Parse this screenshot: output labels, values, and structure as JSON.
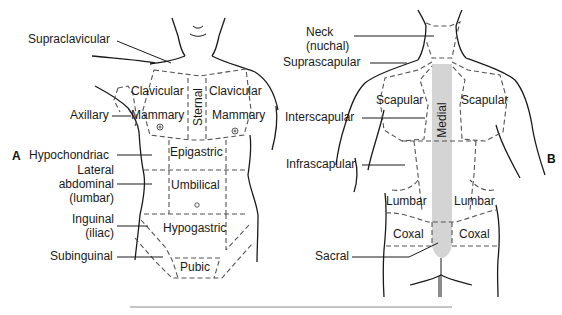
{
  "panels": {
    "A": {
      "letter": "A",
      "view": "anterior",
      "callout_labels": {
        "supraclavicular": "Supraclavicular",
        "axillary": "Axillary",
        "hypochondriac": "Hypochondriac",
        "lateral_abdominal": [
          "Lateral",
          "abdominal",
          "(lumbar)"
        ],
        "inguinal": [
          "Inguinal",
          "(iliac)"
        ],
        "subinguinal": "Subinguinal"
      },
      "region_labels": {
        "clavicular_left": "Clavicular",
        "clavicular_right": "Clavicular",
        "mammary_left": "Mammary",
        "mammary_right": "Mammary",
        "sternal": "Sternal",
        "epigastric": "Epigastric",
        "umbilical": "Umbilical",
        "hypogastric": "Hypogastric",
        "pubic": "Pubic"
      }
    },
    "B": {
      "letter": "B",
      "view": "posterior",
      "callout_labels": {
        "neck": [
          "Neck",
          "(nuchal)"
        ],
        "suprascapular": "Suprascapular",
        "interscapular": "Interscapular",
        "infrascapular": "Infrascapular",
        "sacral": "Sacral"
      },
      "region_labels": {
        "scapular_left": "Scapular",
        "scapular_right": "Scapular",
        "medial": "Medial",
        "lumbar_left": "Lumbar",
        "lumbar_right": "Lumbar",
        "coxal_left": "Coxal",
        "coxal_right": "Coxal"
      }
    }
  },
  "colors": {
    "outline": "#1a1a1a",
    "dashed": "#555555",
    "medial_band": "#d4d4d4",
    "rule": "#888888"
  }
}
